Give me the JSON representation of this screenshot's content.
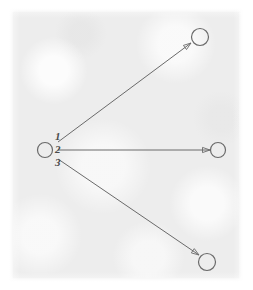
{
  "diagram": {
    "background_color": "#ededed",
    "page_color": "#ffffff",
    "ink_color": "#6a6a6a",
    "label_color": "#4a4a4a",
    "nodes": [
      {
        "id": "source",
        "name": "source-node",
        "cx": 45,
        "cy": 150,
        "r": 7.5
      },
      {
        "id": "target-top",
        "name": "target-node-top",
        "cx": 200,
        "cy": 37,
        "r": 8.5
      },
      {
        "id": "target-mid",
        "name": "target-node-middle",
        "cx": 218,
        "cy": 150,
        "r": 7.5
      },
      {
        "id": "target-bot",
        "name": "target-node-bottom",
        "cx": 207,
        "cy": 262,
        "r": 8.5
      }
    ],
    "edges": [
      {
        "id": "edge-1",
        "label": "1",
        "from": "source",
        "to": "target-top",
        "x1": 58,
        "y1": 142,
        "x2": 191,
        "y2": 43,
        "label_x": 55,
        "label_y": 140,
        "arrow": {
          "tip_x": 191,
          "tip_y": 43,
          "angle_deg": -36.6
        }
      },
      {
        "id": "edge-2",
        "label": "2",
        "from": "source",
        "to": "target-mid",
        "x1": 58,
        "y1": 150,
        "x2": 210,
        "y2": 150,
        "label_x": 55,
        "label_y": 153,
        "arrow": {
          "tip_x": 210,
          "tip_y": 150,
          "angle_deg": 0
        }
      },
      {
        "id": "edge-3",
        "label": "3",
        "from": "source",
        "to": "target-bot",
        "x1": 58,
        "y1": 159,
        "x2": 199,
        "y2": 255,
        "label_x": 55,
        "label_y": 166,
        "arrow": {
          "tip_x": 199,
          "tip_y": 255,
          "angle_deg": 34.3
        }
      }
    ]
  }
}
